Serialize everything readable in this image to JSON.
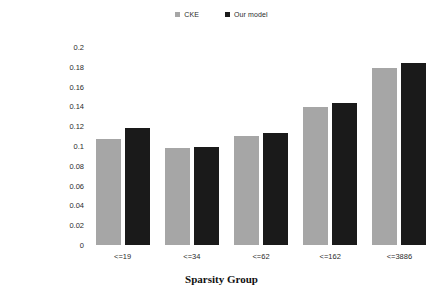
{
  "chart_data": {
    "type": "bar",
    "title": "",
    "subtitle": "",
    "xlabel": "Sparsity Group",
    "ylabel": "NDCG@20",
    "categories": [
      "<=19",
      "<=34",
      "<=62",
      "<=162",
      "<=3886"
    ],
    "series": [
      {
        "name": "CKE",
        "color": "#a6a6a6",
        "values": [
          0.107,
          0.0985,
          0.11,
          0.139,
          0.179
        ]
      },
      {
        "name": "Our model",
        "color": "#1a1a1a",
        "values": [
          0.1185,
          0.099,
          0.113,
          0.1435,
          0.184
        ]
      }
    ],
    "ylim": [
      0,
      0.2
    ],
    "ytick_step": 0.02,
    "ytick_labels": [
      "0.2",
      "0.18",
      "0.16",
      "0.14",
      "0.12",
      "0.1",
      "0.08",
      "0.06",
      "0.04",
      "0.02",
      "0"
    ],
    "ytick_values": [
      0.2,
      0.18,
      0.16,
      0.14,
      0.12,
      0.1,
      0.08,
      0.06,
      0.04,
      0.02,
      0
    ],
    "grid": false,
    "legend_position": "top-center",
    "background_color": "#ffffff"
  },
  "legend": {
    "items": [
      {
        "label": "CKE",
        "color": "#a6a6a6"
      },
      {
        "label": "Our model",
        "color": "#1a1a1a"
      }
    ]
  },
  "axes": {
    "y_title": "NDCG@20",
    "x_title": "Sparsity Group"
  }
}
